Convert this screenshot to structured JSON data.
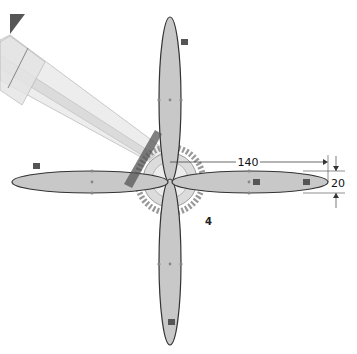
{
  "viewport": {
    "type": "cad-sketch",
    "background": "#ffffff"
  },
  "sketch": {
    "petal_fill": "#c8c8c8",
    "petal_stroke": "#333333",
    "petals": [
      {
        "name": "top",
        "orientation": "vertical"
      },
      {
        "name": "bottom",
        "orientation": "vertical"
      },
      {
        "name": "left",
        "orientation": "horizontal"
      },
      {
        "name": "right",
        "orientation": "horizontal"
      }
    ],
    "gear": {
      "fill": "#d9d9d9",
      "stroke": "#888888"
    },
    "diagonal_beam": {
      "fill": "#e6e6e6",
      "stroke": "#aaaaaa"
    }
  },
  "dimensions": {
    "length": "140",
    "width": "20"
  },
  "annotations": {
    "count_label": "4"
  },
  "relation_icons": [
    "fix-relation-icon-top",
    "fix-relation-icon-left",
    "fix-relation-icon-right-inner",
    "fix-relation-icon-right-outer",
    "fix-relation-icon-bottom"
  ]
}
